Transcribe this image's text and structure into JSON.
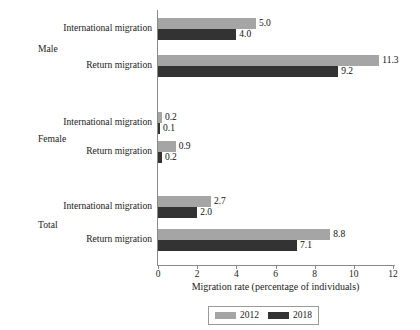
{
  "chart_data": {
    "type": "bar",
    "orientation": "horizontal",
    "title": "",
    "xlabel": "Migration rate (percentage of individuals)",
    "ylabel": "",
    "xlim": [
      0,
      12
    ],
    "xticks": [
      0,
      2,
      4,
      6,
      8,
      10,
      12
    ],
    "xtick_labels": [
      "0",
      "2",
      "4",
      "6",
      "8",
      "10",
      "12"
    ],
    "grid": false,
    "legend_position": "bottom-center",
    "groups": [
      "Male",
      "Female",
      "Total"
    ],
    "categories": [
      "International migration",
      "Return migration",
      "International migration",
      "Return migration",
      "International migration",
      "Return migration"
    ],
    "series": [
      {
        "name": "2012",
        "color": "#a5a5a5",
        "values": [
          5.0,
          11.3,
          0.2,
          0.9,
          2.7,
          8.8
        ]
      },
      {
        "name": "2018",
        "color": "#333333",
        "values": [
          4.0,
          9.2,
          0.1,
          0.2,
          2.0,
          7.1
        ]
      }
    ],
    "value_labels": {
      "2012": [
        "5.0",
        "11.3",
        "0.2",
        "0.9",
        "2.7",
        "8.8"
      ],
      "2018": [
        "4.0",
        "9.2",
        "0.1",
        "0.2",
        "2.0",
        "7.1"
      ]
    }
  },
  "axis": {
    "x_title": "Migration rate (percentage of individuals)",
    "ticks": [
      {
        "value": "0"
      },
      {
        "value": "2"
      },
      {
        "value": "4"
      },
      {
        "value": "6"
      },
      {
        "value": "8"
      },
      {
        "value": "10"
      },
      {
        "value": "12"
      }
    ]
  },
  "groups": [
    {
      "name": "Male",
      "rows": [
        {
          "label": "International migration",
          "v2012": "5.0",
          "v2018": "4.0"
        },
        {
          "label": "Return migration",
          "v2012": "11.3",
          "v2018": "9.2"
        }
      ]
    },
    {
      "name": "Female",
      "rows": [
        {
          "label": "International migration",
          "v2012": "0.2",
          "v2018": "0.1"
        },
        {
          "label": "Return migration",
          "v2012": "0.9",
          "v2018": "0.2"
        }
      ]
    },
    {
      "name": "Total",
      "rows": [
        {
          "label": "International migration",
          "v2012": "2.7",
          "v2018": "2.0"
        },
        {
          "label": "Return migration",
          "v2012": "8.8",
          "v2018": "7.1"
        }
      ]
    }
  ],
  "legend": {
    "items": [
      {
        "label": "2012",
        "color": "#a5a5a5"
      },
      {
        "label": "2018",
        "color": "#333333"
      }
    ]
  }
}
